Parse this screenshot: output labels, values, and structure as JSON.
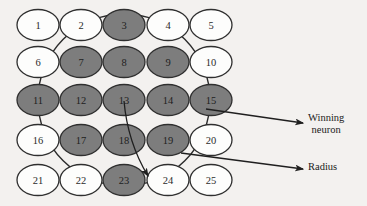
{
  "figure": {
    "type": "self-organizing-map-neighborhood-diagram",
    "background_color": "#f3f1ef",
    "node_shaded_color": "#7d7d7d",
    "node_plain_color": "#fdfdfc",
    "node_border_color": "#2f2f2f",
    "line_color": "#1f1f1f"
  },
  "grid": {
    "rows": 5,
    "cols": 5,
    "node_rx": 21,
    "node_ry": 15.5,
    "col_x": [
      38,
      81,
      124,
      168,
      211
    ],
    "row_y": [
      25,
      62,
      100,
      140,
      180
    ],
    "nodes": [
      {
        "id": 1,
        "label": "1",
        "row": 0,
        "col": 0,
        "shaded": false
      },
      {
        "id": 2,
        "label": "2",
        "row": 0,
        "col": 1,
        "shaded": false
      },
      {
        "id": 3,
        "label": "3",
        "row": 0,
        "col": 2,
        "shaded": true
      },
      {
        "id": 4,
        "label": "4",
        "row": 0,
        "col": 3,
        "shaded": false
      },
      {
        "id": 5,
        "label": "5",
        "row": 0,
        "col": 4,
        "shaded": false
      },
      {
        "id": 6,
        "label": "6",
        "row": 1,
        "col": 0,
        "shaded": false
      },
      {
        "id": 7,
        "label": "7",
        "row": 1,
        "col": 1,
        "shaded": true
      },
      {
        "id": 8,
        "label": "8",
        "row": 1,
        "col": 2,
        "shaded": true
      },
      {
        "id": 9,
        "label": "9",
        "row": 1,
        "col": 3,
        "shaded": true
      },
      {
        "id": 10,
        "label": "10",
        "row": 1,
        "col": 4,
        "shaded": false
      },
      {
        "id": 11,
        "label": "11",
        "row": 2,
        "col": 0,
        "shaded": true
      },
      {
        "id": 12,
        "label": "12",
        "row": 2,
        "col": 1,
        "shaded": true
      },
      {
        "id": 13,
        "label": "13",
        "row": 2,
        "col": 2,
        "shaded": true
      },
      {
        "id": 14,
        "label": "14",
        "row": 2,
        "col": 3,
        "shaded": true
      },
      {
        "id": 15,
        "label": "15",
        "row": 2,
        "col": 4,
        "shaded": true
      },
      {
        "id": 16,
        "label": "16",
        "row": 3,
        "col": 0,
        "shaded": false
      },
      {
        "id": 17,
        "label": "17",
        "row": 3,
        "col": 1,
        "shaded": true
      },
      {
        "id": 18,
        "label": "18",
        "row": 3,
        "col": 2,
        "shaded": true
      },
      {
        "id": 19,
        "label": "19",
        "row": 3,
        "col": 3,
        "shaded": true
      },
      {
        "id": 20,
        "label": "20",
        "row": 3,
        "col": 4,
        "shaded": false
      },
      {
        "id": 21,
        "label": "21",
        "row": 4,
        "col": 0,
        "shaded": false
      },
      {
        "id": 22,
        "label": "22",
        "row": 4,
        "col": 1,
        "shaded": false
      },
      {
        "id": 23,
        "label": "23",
        "row": 4,
        "col": 2,
        "shaded": true
      },
      {
        "id": 24,
        "label": "24",
        "row": 4,
        "col": 3,
        "shaded": false
      },
      {
        "id": 25,
        "label": "25",
        "row": 4,
        "col": 4,
        "shaded": false
      }
    ]
  },
  "neighborhood_circle": {
    "center_x": 124,
    "center_y": 100,
    "radius": 86,
    "description": "neighborhood boundary drawn around winning neuron"
  },
  "radius_indicator": {
    "from_x": 124,
    "from_y": 101,
    "to_x": 148,
    "to_y": 176
  },
  "callouts": [
    {
      "name": "winning-neuron",
      "text_line_1": "Winning",
      "text_line_2": "neuron",
      "arrow_start_x": 206,
      "arrow_start_y": 109,
      "arrow_end_x": 303,
      "arrow_end_y": 123
    },
    {
      "name": "radius",
      "text_line_1": "Radius",
      "text_line_2": "",
      "arrow_start_x": 181,
      "arrow_start_y": 153,
      "arrow_end_x": 303,
      "arrow_end_y": 169
    }
  ]
}
